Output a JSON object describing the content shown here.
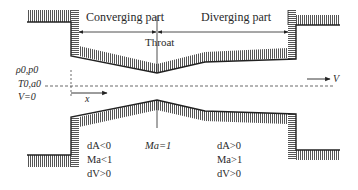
{
  "diagram": {
    "labels": {
      "converging": "Converging part",
      "diverging": "Diverging part",
      "throat": "Throat",
      "stagnation_line1": "ρ0,p0",
      "stagnation_line2": "T0,a0",
      "stagnation_line3": "V=0",
      "x_axis": "x",
      "velocity": "V",
      "throat_mach": "Ma=1"
    },
    "converging_conditions": [
      "dA<0",
      "Ma<1",
      "dV>0"
    ],
    "diverging_conditions": [
      "dA>0",
      "Ma>1",
      "dV>0"
    ],
    "colors": {
      "wall_line": "#222222",
      "hatch": "#555555",
      "text": "#2a2a2a"
    }
  }
}
